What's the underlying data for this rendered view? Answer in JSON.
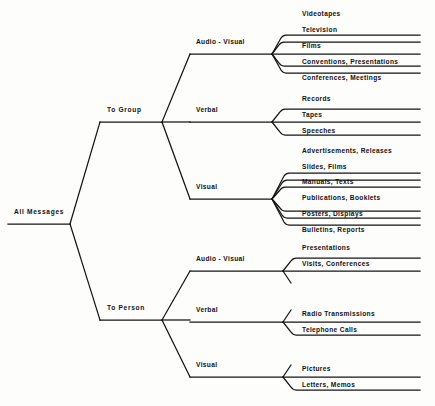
{
  "diagram": {
    "type": "tree",
    "orientation": "left-to-right",
    "line_color": "#141414",
    "text_color": "#111111",
    "background": "#fdfdfc",
    "root": {
      "label": "All Messages",
      "x": 8,
      "y": 215,
      "underline_y": 224,
      "underline_x1": 8,
      "underline_x2": 70
    },
    "level1": [
      {
        "label": "To Group",
        "x": 106,
        "y": 113,
        "underline_y": 122,
        "underline_x1": 100,
        "underline_x2": 162
      },
      {
        "label": "To Person",
        "x": 106,
        "y": 311,
        "underline_y": 320,
        "underline_x1": 100,
        "underline_x2": 162
      }
    ],
    "level2": [
      {
        "parent": "To Group",
        "label": "Audio - Visual",
        "x": 196,
        "y": 45,
        "underline_y": 54,
        "underline_x1": 190,
        "underline_x2": 272
      },
      {
        "parent": "To Group",
        "label": "Verbal",
        "x": 196,
        "y": 113,
        "underline_y": 122,
        "underline_x1": 190,
        "underline_x2": 272
      },
      {
        "parent": "To Group",
        "label": "Visual",
        "x": 196,
        "y": 190,
        "underline_y": 199,
        "underline_x1": 190,
        "underline_x2": 272
      },
      {
        "parent": "To Person",
        "label": "Audio - Visual",
        "x": 196,
        "y": 262,
        "underline_y": 271,
        "underline_x1": 190,
        "underline_x2": 283
      },
      {
        "parent": "To Person",
        "label": "Verbal",
        "x": 196,
        "y": 313,
        "underline_y": 322,
        "underline_x1": 190,
        "underline_x2": 283
      },
      {
        "parent": "To Person",
        "label": "Visual",
        "x": 196,
        "y": 368,
        "underline_y": 377,
        "underline_x1": 190,
        "underline_x2": 283
      }
    ],
    "leaves": [
      {
        "group": "To Group / Audio - Visual",
        "label": "Videotapes",
        "y": 20
      },
      {
        "group": "To Group / Audio - Visual",
        "label": "Television",
        "y": 36
      },
      {
        "group": "To Group / Audio - Visual",
        "label": "Films",
        "y": 52
      },
      {
        "group": "To Group / Audio - Visual",
        "label": "Conventions,  Presentations",
        "y": 68
      },
      {
        "group": "To Group / Audio - Visual",
        "label": "Conferences,  Meetings",
        "y": 84
      },
      {
        "group": "To Group / Verbal",
        "label": "Records",
        "y": 105
      },
      {
        "group": "To Group / Verbal",
        "label": "Tapes",
        "y": 121
      },
      {
        "group": "To Group / Verbal",
        "label": "Speeches",
        "y": 137
      },
      {
        "group": "To Group / Visual",
        "label": "Advertisements,  Releases",
        "y": 157
      },
      {
        "group": "To Group / Visual",
        "label": "Slides,  Films",
        "y": 173
      },
      {
        "group": "To Group / Visual",
        "label": "Manuals,  Texts",
        "y": 188
      },
      {
        "group": "To Group / Visual",
        "label": "Publications,  Booklets",
        "y": 204
      },
      {
        "group": "To Group / Visual",
        "label": "Posters,  Displays",
        "y": 220
      },
      {
        "group": "To Group / Visual",
        "label": "Bulletins,  Reports",
        "y": 236
      },
      {
        "group": "To Person / Audio - Visual",
        "label": "Presentations",
        "y": 254
      },
      {
        "group": "To Person / Audio - Visual",
        "label": "Visits,  Conferences",
        "y": 270
      },
      {
        "group": "To Person / Verbal",
        "label": "Radio Transmissions",
        "y": 320
      },
      {
        "group": "To Person / Verbal",
        "label": "Telephone Calls",
        "y": 336
      },
      {
        "group": "To Person / Visual",
        "label": "Pictures",
        "y": 375
      },
      {
        "group": "To Person / Visual",
        "label": "Letters,  Memos",
        "y": 391
      }
    ]
  }
}
